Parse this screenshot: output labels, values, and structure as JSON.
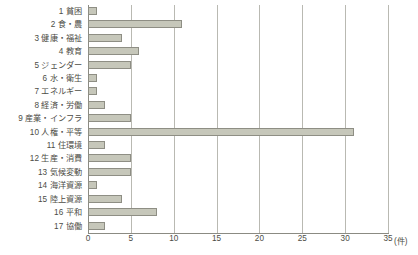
{
  "chart_data": {
    "type": "bar",
    "orientation": "horizontal",
    "title": "",
    "xlabel": "(件)",
    "ylabel": "",
    "xlim": [
      0,
      35
    ],
    "xticks": [
      0,
      5,
      10,
      15,
      20,
      25,
      30,
      35
    ],
    "xtick_labels": [
      "0",
      "5",
      "10",
      "15",
      "20",
      "25",
      "30",
      "35"
    ],
    "unit_label": "(件)",
    "grid": true,
    "legend": false,
    "bar_color": "#c6c7ba",
    "bar_border_color": "#8e8e84",
    "gridline_color": "#b9b9b2",
    "categories": [
      "1 貧困",
      "2 食・農",
      "3 健康・福祉",
      "4 教育",
      "5 ジェンダー",
      "6 水・衛生",
      "7 エネルギー",
      "8 経済・労働",
      "9 産業・インフラ",
      "10 人権・平等",
      "11 住環境",
      "12 生産・消費",
      "13 気候変動",
      "14 海洋資源",
      "15 陸上資源",
      "16 平和",
      "17 協働"
    ],
    "values": [
      1,
      11,
      4,
      6,
      5,
      1,
      1,
      2,
      5,
      31,
      2,
      5,
      5,
      1,
      4,
      8,
      2
    ]
  }
}
